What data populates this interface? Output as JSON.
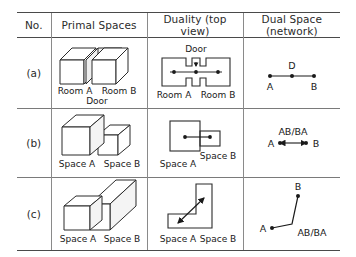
{
  "table": {
    "headers": [
      "No.",
      "Primal Spaces",
      "Duality (top view)",
      "Dual Space (network)"
    ],
    "rows": [
      {
        "no": "(a)",
        "primal": {
          "labels": [
            "Room A",
            "Room B",
            "Door"
          ]
        },
        "duality": {
          "labels": [
            "Door",
            "Room A",
            "Room B"
          ]
        },
        "network": {
          "labels": [
            "D",
            "A",
            "B"
          ]
        }
      },
      {
        "no": "(b)",
        "primal": {
          "labels": [
            "Space A",
            "Space B"
          ]
        },
        "duality": {
          "labels": [
            "Space A",
            "Space B"
          ]
        },
        "network": {
          "labels": [
            "AB/BA",
            "A",
            "B"
          ]
        }
      },
      {
        "no": "(c)",
        "primal": {
          "labels": [
            "Space A",
            "Space B"
          ]
        },
        "duality": {
          "labels": [
            "Space A",
            "Space B"
          ]
        },
        "network": {
          "labels": [
            "B",
            "A",
            "AB/BA"
          ]
        }
      }
    ]
  },
  "style": {
    "line_color": "#2b2b2b",
    "grid_color": "#7a7a7a",
    "border_color": "#4a4a4a",
    "face_color": "#ffffff",
    "shade_color": "#f0f0f0"
  }
}
